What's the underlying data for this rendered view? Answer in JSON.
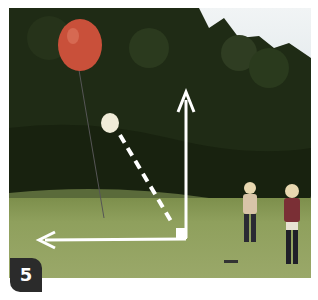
{
  "figure": {
    "step_number": "5",
    "colors": {
      "balloon": "#c9503a",
      "small_balloon": "#f0ecd8",
      "trees": "#1e2a14",
      "grass": "#8fa05d",
      "sky": "#eef2f4",
      "arrows": "#ffffff",
      "badge": "#2b2b2b"
    },
    "annotations": [
      {
        "type": "arrow",
        "direction": "up",
        "label": ""
      },
      {
        "type": "arrow",
        "direction": "left",
        "label": ""
      },
      {
        "type": "dashed-line",
        "label": ""
      }
    ]
  }
}
